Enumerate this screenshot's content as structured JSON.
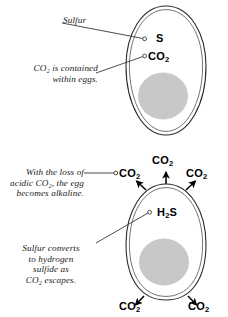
{
  "figure": {
    "title": "Sulfur and carbon dioxide movement in eggs",
    "background_color": "#ffffff",
    "ink_color": "#000000",
    "yolk_color": "#c8c8c8",
    "panels": [
      {
        "id": "fresh-egg",
        "name": "fresh egg panel",
        "callouts": [
          {
            "id": "sulfur-callout",
            "text": "Sulfur"
          },
          {
            "id": "co2-contained-callout",
            "text": "CO₂ is contained\nwithin eggs."
          }
        ],
        "labels": [
          {
            "id": "sulfur-symbol",
            "formula": "S",
            "sub": ""
          },
          {
            "id": "carbon-dioxide-symbol",
            "formula": "CO",
            "sub": "2"
          }
        ]
      },
      {
        "id": "aging-egg",
        "name": "aging egg panel",
        "callouts": [
          {
            "id": "alkaline-callout",
            "text": "With the loss of\nacidic CO₂, the egg\nbecomes alkaline."
          },
          {
            "id": "sulfide-callout",
            "text": "Sulfur converts\nto hydrogen\nsulfide as\nCO₂ escapes."
          }
        ],
        "labels": [
          {
            "id": "co2-escape-top",
            "formula": "CO",
            "sub": "2"
          },
          {
            "id": "co2-escape-left",
            "formula": "CO",
            "sub": "2"
          },
          {
            "id": "co2-escape-right",
            "formula": "CO",
            "sub": "2"
          },
          {
            "id": "hydrogen-sulfide",
            "formula": "H",
            "sub": "2",
            "formula_tail": "S"
          },
          {
            "id": "co2-escape-bottom-left",
            "formula": "CO",
            "sub": "2"
          },
          {
            "id": "co2-escape-bottom-right",
            "formula": "CO",
            "sub": "2"
          }
        ]
      }
    ]
  }
}
